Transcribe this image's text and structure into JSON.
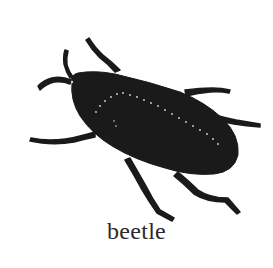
{
  "figure": {
    "caption": "beetle",
    "colors": {
      "silhouette": "#1a1a1a",
      "background": "#ffffff",
      "caption": "#2a2a2a",
      "dots": "#d8d8d8"
    }
  }
}
